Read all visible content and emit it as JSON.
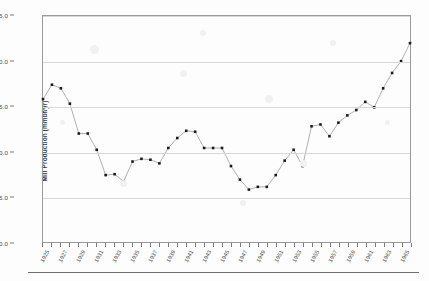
{
  "chart_data": {
    "type": "line",
    "title": "",
    "xlabel": "",
    "ylabel": "Mill Production (mmbf/yr)",
    "ylim": [
      0.0,
      25.0
    ],
    "xlim": [
      1925,
      1966
    ],
    "grid": true,
    "legend": "none",
    "marker": "filled-square",
    "ytick_labels": [
      "0.0",
      "5.0",
      "10.0",
      "15.0",
      "20.0",
      "25.0"
    ],
    "ytick_values": [
      0.0,
      5.0,
      10.0,
      15.0,
      20.0,
      25.0
    ],
    "xtick_labels": [
      "1925",
      "1927",
      "1929",
      "1931",
      "1933",
      "1935",
      "1937",
      "1939",
      "1941",
      "1943",
      "1945",
      "1947",
      "1949",
      "1951",
      "1953",
      "1955",
      "1957",
      "1959",
      "1961",
      "1963",
      "1965"
    ],
    "xtick_values": [
      1925,
      1927,
      1929,
      1931,
      1933,
      1935,
      1937,
      1939,
      1941,
      1943,
      1945,
      1947,
      1949,
      1951,
      1953,
      1955,
      1957,
      1959,
      1961,
      1963,
      1965
    ],
    "x": [
      1925,
      1926,
      1927,
      1928,
      1929,
      1930,
      1931,
      1932,
      1933,
      1934,
      1935,
      1936,
      1937,
      1938,
      1939,
      1940,
      1941,
      1942,
      1943,
      1944,
      1945,
      1946,
      1947,
      1948,
      1949,
      1950,
      1951,
      1952,
      1953,
      1954,
      1955,
      1956,
      1957,
      1958,
      1959,
      1960,
      1961,
      1962,
      1963,
      1964,
      1965,
      1966
    ],
    "values": [
      15.8,
      17.4,
      17.0,
      15.3,
      12.0,
      12.0,
      10.2,
      7.4,
      7.5,
      6.7,
      8.9,
      9.2,
      9.1,
      8.7,
      10.4,
      11.5,
      12.3,
      12.2,
      10.4,
      10.4,
      10.4,
      8.4,
      6.9,
      5.8,
      6.1,
      6.1,
      7.4,
      9.0,
      10.2,
      8.4,
      12.8,
      13.0,
      11.7,
      13.2,
      14.0,
      14.6,
      15.5,
      14.9,
      17.0,
      18.7,
      20.0,
      22.0
    ],
    "series": [
      {
        "name": "Mill Production",
        "values": [
          15.8,
          17.4,
          17.0,
          15.3,
          12.0,
          12.0,
          10.2,
          7.4,
          7.5,
          6.7,
          8.9,
          9.2,
          9.1,
          8.7,
          10.4,
          11.5,
          12.3,
          12.2,
          10.4,
          10.4,
          10.4,
          8.4,
          6.9,
          5.8,
          6.1,
          6.1,
          7.4,
          9.0,
          10.2,
          8.4,
          12.8,
          13.0,
          11.7,
          13.2,
          14.0,
          14.6,
          15.5,
          14.9,
          17.0,
          18.7,
          20.0,
          22.0
        ]
      }
    ],
    "colors": {
      "marker": "#1a1a1a",
      "line": "#8d8d8d",
      "grid": "#d8d8d8",
      "axis": "#9a9a9a",
      "background": "#fdfdfd",
      "text": "#3a3a3a"
    }
  }
}
